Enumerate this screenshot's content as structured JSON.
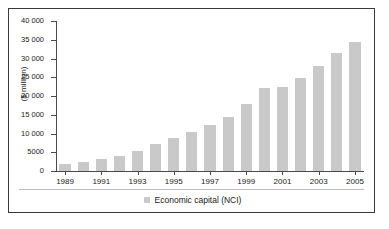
{
  "chart_data": {
    "type": "bar",
    "title": "",
    "subtitle": "",
    "xlabel": "",
    "ylabel": "($ million)",
    "ylim": [
      0,
      40000
    ],
    "ytick_values": [
      0,
      5000,
      10000,
      15000,
      20000,
      25000,
      30000,
      35000,
      40000
    ],
    "ytick_labels": [
      "0",
      "5000",
      "10 000",
      "15 000",
      "20 000",
      "25 000",
      "30 000",
      "35 000",
      "40 000"
    ],
    "grid": false,
    "legend_position": "bottom",
    "bar_color": "#c9c9c9",
    "axis_color": "#4a4a4a",
    "frame_color": "#3a3a3a",
    "categories": [
      "1989",
      "1990",
      "1991",
      "1992",
      "1993",
      "1994",
      "1995",
      "1996",
      "1997",
      "1998",
      "1999",
      "2000",
      "2001",
      "2002",
      "2003",
      "2004",
      "2005"
    ],
    "xtick_labels": [
      "1989",
      "1991",
      "1993",
      "1995",
      "1997",
      "1999",
      "2001",
      "2003",
      "2005"
    ],
    "series": [
      {
        "name": "Economic capital (NCI)",
        "values": [
          1800,
          2500,
          3200,
          4000,
          5300,
          7100,
          8900,
          10300,
          12200,
          14400,
          17900,
          22100,
          22400,
          24900,
          27900,
          31500,
          34300
        ]
      }
    ],
    "legend": [
      "Economic capital (NCI)"
    ]
  }
}
